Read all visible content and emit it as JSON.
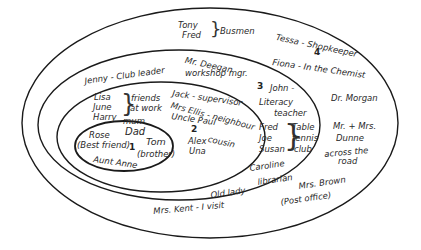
{
  "diagram": {
    "type": "concentric-circles-social-network",
    "rings": [
      {
        "number": "1",
        "members": [
          "Mum",
          "Dad",
          "Rose (Best friend)",
          "Tom (brother)",
          "Aunt Anne"
        ]
      },
      {
        "number": "2",
        "members": [
          "Lisa",
          "June",
          "Harry",
          "friends at work",
          "Jack - supervisor",
          "Mrs Ellis - neighbour",
          "Uncle Paul",
          "Alex",
          "Una",
          "cousin"
        ]
      },
      {
        "number": "3",
        "members": [
          "Jenny - Club leader",
          "Mr. Deegan workshop mgr.",
          "John - Literacy teacher",
          "Fred",
          "Joe",
          "Susan",
          "Table tennis club",
          "Caroline librarian",
          "Mrs. Kent - Old lady I visit"
        ]
      },
      {
        "number": "4",
        "members": [
          "Tony",
          "Fred",
          "Busmen",
          "Tessa - Shopkeeper",
          "Fiona - In the Chemist",
          "Dr. Morgan",
          "Mr. + Mrs. Dunne across the road",
          "Mrs. Brown (Post office)"
        ]
      }
    ]
  },
  "labels": {
    "ring1_num": "1",
    "ring2_num": "2",
    "ring3_num": "3",
    "ring4_num": "4",
    "mum": "mum",
    "dad": "Dad",
    "rose": "Rose",
    "best_friend": "(Best friend)",
    "tom": "Tom",
    "brother": "(brother)",
    "aunt_anne": "Aunt Anne",
    "lisa": "Lisa",
    "june": "June",
    "harry": "Harry",
    "friends": "friends",
    "at_work": "at work",
    "jack": "Jack - supervisor",
    "mrs_ellis": "Mrs Ellis - neighbour",
    "uncle_paul": "Uncle Paul",
    "alex": "Alex",
    "cousin": "cousin",
    "una": "Una",
    "jenny": "Jenny - Club leader",
    "deegan1": "Mr. Deegan",
    "deegan2": "workshop mgr.",
    "john": "John -",
    "literacy": "Literacy",
    "teacher": "teacher",
    "fred3": "Fred",
    "joe": "Joe",
    "susan": "Susan",
    "table": "Table",
    "tennis": "tennis",
    "club": "club",
    "caroline": "Caroline",
    "librarian": "librarian",
    "old_lady": "Old lady",
    "mrs_kent": "Mrs. Kent - I visit",
    "tony": "Tony",
    "fred4": "Fred",
    "busmen": "Busmen",
    "tessa": "Tessa - Shopkeeper",
    "fiona": "Fiona - In the Chemist",
    "dr_morgan": "Dr. Morgan",
    "dunne1": "Mr. + Mrs.",
    "dunne2": "Dunne",
    "across": "across the",
    "road": "road",
    "mrs_brown": "Mrs. Brown",
    "post_office": "(Post office)",
    "brace": "}",
    "brace_left": "]"
  },
  "colors": {
    "line": "#1a1a1a",
    "background": "#ffffff"
  }
}
